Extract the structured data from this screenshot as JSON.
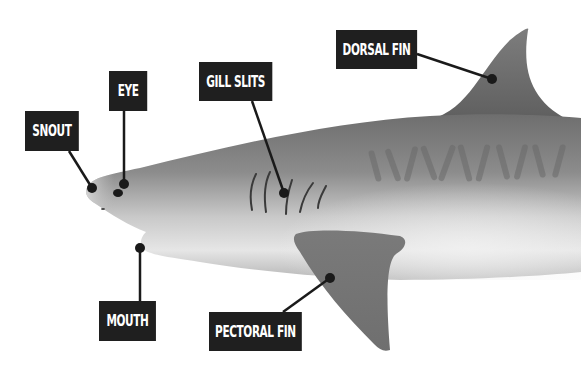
{
  "diagram": {
    "label_bg": "#1f1f1f",
    "label_text_color": "#ffffff",
    "leader_color": "#1a1a1a",
    "body_color": "#8f8f8f",
    "fin_color": "#7a7a7a",
    "labels": [
      {
        "id": "snout",
        "text": "SNOUT"
      },
      {
        "id": "eye",
        "text": "EYE"
      },
      {
        "id": "gill-slits",
        "text": "GILL SLITS"
      },
      {
        "id": "dorsal-fin",
        "text": "DORSAL FIN"
      },
      {
        "id": "mouth",
        "text": "MOUTH"
      },
      {
        "id": "pectoral-fin",
        "text": "PECTORAL FIN"
      }
    ]
  }
}
